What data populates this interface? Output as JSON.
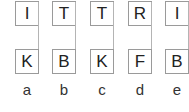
{
  "diagram": {
    "columns": [
      {
        "label": "a",
        "top": "I",
        "bottom": "K"
      },
      {
        "label": "b",
        "top": "T",
        "bottom": "B"
      },
      {
        "label": "c",
        "top": "T",
        "bottom": "K"
      },
      {
        "label": "d",
        "top": "R",
        "bottom": "F"
      },
      {
        "label": "e",
        "top": "I",
        "bottom": "B"
      }
    ],
    "colors": {
      "box_border": "#9a9a9a",
      "connector": "#b4b4b4",
      "text": "#222222"
    }
  }
}
